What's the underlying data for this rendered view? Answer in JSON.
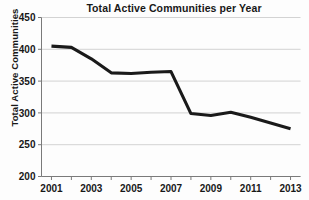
{
  "chart_data": {
    "type": "line",
    "title": "Total Active Communities per Year",
    "xlabel": "",
    "ylabel": "Total Active Communities",
    "x": [
      2001,
      2002,
      2003,
      2004,
      2005,
      2006,
      2007,
      2008,
      2009,
      2010,
      2011,
      2012,
      2013
    ],
    "values": [
      405,
      403,
      385,
      363,
      362,
      364,
      365,
      299,
      296,
      301,
      293,
      284,
      275
    ],
    "series": [
      {
        "name": "Total Active Communities",
        "values": [
          405,
          403,
          385,
          363,
          362,
          364,
          365,
          299,
          296,
          301,
          293,
          284,
          275
        ]
      }
    ],
    "xlim": [
      2000.5,
      2013.5
    ],
    "ylim": [
      200,
      450
    ],
    "y_ticks": [
      200,
      250,
      300,
      350,
      400,
      450
    ],
    "y_tick_labels": [
      "200",
      "250",
      "300",
      "350",
      "400",
      "450"
    ],
    "x_ticks": [
      2001,
      2002,
      2003,
      2004,
      2005,
      2006,
      2007,
      2008,
      2009,
      2010,
      2011,
      2012,
      2013
    ],
    "x_tick_labels": [
      "2001",
      "",
      "2003",
      "",
      "2005",
      "",
      "2007",
      "",
      "2009",
      "",
      "2011",
      "",
      "2013"
    ],
    "x_labeled_ticks": [
      "2001",
      "2003",
      "2005",
      "2007",
      "2009",
      "2011",
      "2013"
    ],
    "grid": "horizontal",
    "legend": "none",
    "line_color": "#1a1a1a",
    "grid_color": "#c8c8c8",
    "axis_color": "#7a7a7a",
    "background_color": "#fdfdfd",
    "text_color": "#181818"
  }
}
